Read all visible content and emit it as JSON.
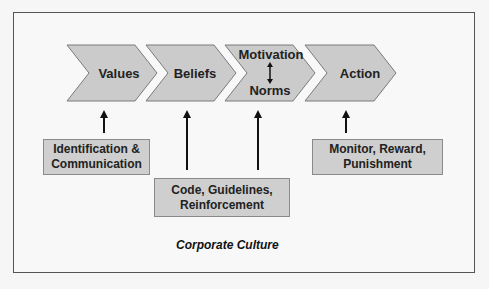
{
  "diagram": {
    "title": "Corporate Culture",
    "chevrons": [
      {
        "label": "Values"
      },
      {
        "label": "Beliefs"
      },
      {
        "label_top": "Motivation",
        "label_bottom": "Norms",
        "connector": "double-arrow"
      },
      {
        "label": "Action"
      }
    ],
    "boxes": [
      {
        "line1": "Identification &",
        "line2": "Communication",
        "targets": [
          "Values"
        ]
      },
      {
        "line1": "Code, Guidelines,",
        "line2": "Reinforcement",
        "targets": [
          "Beliefs",
          "Motivation / Norms"
        ]
      },
      {
        "line1": "Monitor, Reward,",
        "line2": "Punishment",
        "targets": [
          "Action"
        ]
      }
    ],
    "colors": {
      "chevron_fill": "#cbcbcb",
      "box_fill": "#cfcfcf",
      "outline": "#7a7a7a",
      "arrow": "#111111",
      "background": "#f6f6f6"
    }
  }
}
